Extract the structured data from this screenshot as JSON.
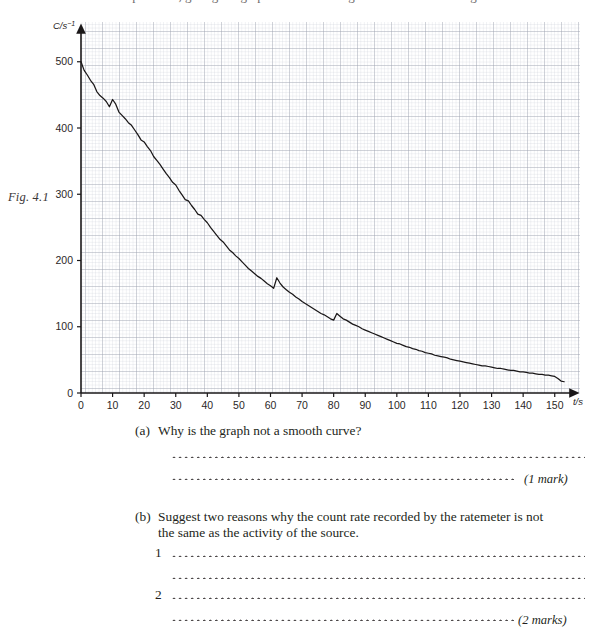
{
  "header": {
    "cropped_line": "experiment, giving the graph of count rate against time shown in Fig. 4.1."
  },
  "figure": {
    "label": "Fig. 4.1",
    "y_axis_title": "C/s",
    "y_axis_exponent": "−1",
    "x_axis_title": "t/s"
  },
  "chart_data": {
    "type": "line",
    "title": "",
    "xlabel": "t/s",
    "ylabel": "C/s⁻¹",
    "xlim": [
      0,
      158
    ],
    "ylim": [
      0,
      560
    ],
    "xticks": [
      0,
      10,
      20,
      30,
      40,
      50,
      60,
      70,
      80,
      90,
      100,
      110,
      120,
      130,
      140,
      150
    ],
    "yticks": [
      0,
      100,
      200,
      300,
      400,
      500
    ],
    "xtick_labels": [
      "0",
      "10",
      "20",
      "30",
      "40",
      "50",
      "60",
      "70",
      "80",
      "90",
      "100",
      "110",
      "120",
      "130",
      "140",
      "150"
    ],
    "ytick_labels": [
      "0",
      "100",
      "200",
      "300",
      "400",
      "500"
    ],
    "grid": true,
    "grid_minor_step_x": 2,
    "grid_minor_step_y": 20,
    "grid_major_step_x": 10,
    "grid_major_step_y": 100,
    "legend": "none",
    "series_name": "count rate",
    "line_color": "#1a1718",
    "x": [
      0,
      1,
      2,
      3,
      4,
      5,
      6,
      7,
      8,
      9,
      10,
      11,
      12,
      13,
      14,
      15,
      16,
      17,
      18,
      19,
      20,
      21,
      22,
      23,
      24,
      25,
      26,
      27,
      28,
      29,
      30,
      31,
      32,
      33,
      34,
      35,
      36,
      37,
      38,
      39,
      40,
      41,
      42,
      43,
      44,
      45,
      46,
      47,
      48,
      49,
      50,
      51,
      52,
      53,
      54,
      55,
      56,
      57,
      58,
      59,
      60,
      61,
      62,
      63,
      64,
      65,
      66,
      67,
      68,
      69,
      70,
      71,
      72,
      73,
      74,
      75,
      76,
      77,
      78,
      79,
      80,
      81,
      82,
      83,
      84,
      85,
      86,
      87,
      88,
      89,
      90,
      91,
      92,
      93,
      94,
      95,
      96,
      97,
      98,
      99,
      100,
      101,
      102,
      103,
      104,
      105,
      106,
      107,
      108,
      109,
      110,
      111,
      112,
      113,
      114,
      115,
      116,
      117,
      118,
      119,
      120,
      121,
      122,
      123,
      124,
      125,
      126,
      127,
      128,
      129,
      130,
      131,
      132,
      133,
      134,
      135,
      136,
      137,
      138,
      139,
      140,
      141,
      142,
      143,
      144,
      145,
      146,
      147,
      148,
      149,
      150,
      151,
      152,
      153
    ],
    "y": [
      500,
      487,
      480,
      472,
      466,
      455,
      449,
      445,
      440,
      432,
      443,
      436,
      424,
      419,
      414,
      408,
      404,
      397,
      390,
      382,
      379,
      372,
      366,
      357,
      351,
      345,
      338,
      331,
      325,
      318,
      314,
      306,
      299,
      292,
      290,
      283,
      277,
      270,
      268,
      262,
      257,
      250,
      244,
      238,
      232,
      228,
      222,
      216,
      212,
      207,
      203,
      198,
      193,
      188,
      184,
      180,
      176,
      173,
      169,
      165,
      162,
      158,
      174,
      166,
      160,
      156,
      152,
      149,
      145,
      142,
      138,
      135,
      132,
      129,
      126,
      123,
      120,
      118,
      115,
      112,
      110,
      120,
      116,
      112,
      110,
      107,
      104,
      102,
      100,
      97,
      95,
      93,
      91,
      89,
      87,
      85,
      83,
      81,
      79,
      77,
      75,
      74,
      72,
      70,
      69,
      67,
      66,
      64,
      63,
      61,
      60,
      59,
      57,
      56,
      55,
      54,
      53,
      51,
      50,
      49,
      48,
      47,
      46,
      45,
      44,
      43,
      42,
      41,
      41,
      40,
      39,
      38,
      37,
      37,
      36,
      35,
      34,
      34,
      33,
      32,
      32,
      31,
      30,
      30,
      29,
      28,
      28,
      27,
      27,
      26,
      25,
      22,
      18,
      17
    ]
  },
  "questions": [
    {
      "label": "(a)",
      "text": "Why is the graph not a smooth curve?",
      "marks": "(1 mark)"
    },
    {
      "label": "(b)",
      "text_line1": "Suggest two reasons why the count rate recorded by the ratemeter is not",
      "text_line2": "the same as the activity of the source.",
      "item1": "1",
      "item2": "2",
      "marks": "(2 marks)"
    }
  ]
}
